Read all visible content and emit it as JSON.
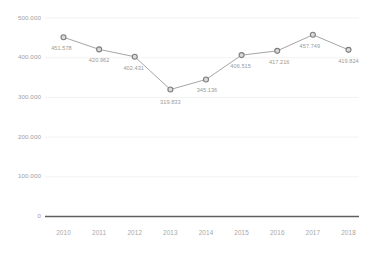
{
  "chart_data": {
    "type": "line",
    "title": "",
    "subtitle": "",
    "xlabel": "",
    "ylabel": "",
    "categories": [
      "2010",
      "2011",
      "2012",
      "2013",
      "2014",
      "2015",
      "2016",
      "2017",
      "2018"
    ],
    "values": [
      451578,
      420962,
      402431,
      319833,
      345136,
      406515,
      417216,
      457749,
      419824
    ],
    "point_labels": [
      "451.578",
      "420.962",
      "402.431",
      "319.833",
      "345.136",
      "406.515",
      "417.216",
      "457.749",
      "419.824"
    ],
    "ylim": [
      0,
      500000
    ],
    "ytick_values": [
      0,
      100000,
      200000,
      300000,
      400000,
      500000
    ],
    "ytick_labels": [
      "0",
      "100.000",
      "200.000",
      "300.000",
      "400.000",
      "500.000"
    ],
    "grid": true,
    "legend": "none",
    "number_format": "period-thousands-separator",
    "colors": {
      "line": "#9b9b9b",
      "marker_fill": "#d9d9d9",
      "marker_stroke": "#7d7d7d",
      "gridline": "#ededed",
      "axis": "#5f5f5f",
      "tick_text": "#a0a0a0",
      "label_text": "#9a9a9a",
      "background": "#ffffff"
    },
    "label_offsets": [
      {
        "dx": -2,
        "dy": 9
      },
      {
        "dx": 0,
        "dy": 9
      },
      {
        "dx": -1,
        "dy": 9
      },
      {
        "dx": 0,
        "dy": 10
      },
      {
        "dx": 1,
        "dy": 9
      },
      {
        "dx": -1,
        "dy": 9
      },
      {
        "dx": 2,
        "dy": 9
      },
      {
        "dx": -3,
        "dy": 9
      },
      {
        "dx": 0,
        "dy": 9
      }
    ]
  }
}
